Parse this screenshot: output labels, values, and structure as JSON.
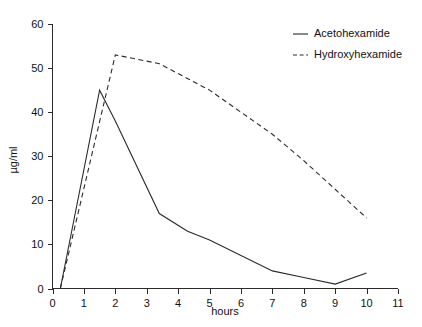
{
  "chart_data": {
    "type": "line",
    "title": "",
    "xlabel": "hours",
    "ylabel": "µg/ml",
    "xlim": [
      0,
      11
    ],
    "ylim": [
      0,
      60
    ],
    "xticks": [
      0,
      1,
      2,
      3,
      4,
      5,
      6,
      7,
      8,
      9,
      10,
      11
    ],
    "yticks": [
      0,
      10,
      20,
      30,
      40,
      50,
      60
    ],
    "grid": false,
    "legend_position": "top-right",
    "series": [
      {
        "name": "Acetohexamide",
        "style": "solid",
        "color": "#2b2b2b",
        "x": [
          0.25,
          1.5,
          2.0,
          3.4,
          4.3,
          5.0,
          7.0,
          8.0,
          9.0,
          10.0
        ],
        "y": [
          0,
          45,
          38,
          17,
          13,
          11,
          4,
          2.5,
          1,
          3.5
        ]
      },
      {
        "name": "Hydroxyhexamide",
        "style": "dashed",
        "color": "#2b2b2b",
        "x": [
          0.25,
          2.0,
          3.4,
          5.0,
          7.0,
          8.0,
          10.0
        ],
        "y": [
          0,
          53,
          51,
          45,
          35,
          29,
          16
        ]
      }
    ]
  },
  "legend": {
    "entries": [
      {
        "label": "Acetohexamide",
        "style": "solid"
      },
      {
        "label": "Hydroxyhexamide",
        "style": "dashed"
      }
    ]
  },
  "axes": {
    "x_label": "hours",
    "y_label": "µg/ml",
    "x_tick_labels": [
      "0",
      "1",
      "2",
      "3",
      "4",
      "5",
      "6",
      "7",
      "8",
      "9",
      "10",
      "11"
    ],
    "y_tick_labels": [
      "0",
      "10",
      "20",
      "30",
      "40",
      "50",
      "60"
    ]
  }
}
